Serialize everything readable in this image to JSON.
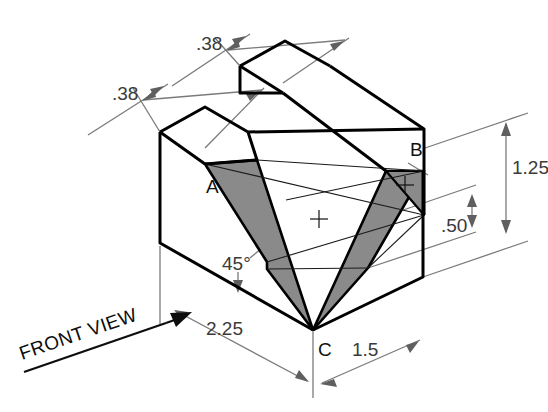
{
  "drawing": {
    "title_label": "FRONT VIEW",
    "background_color": "#ffffff",
    "line_color": "#000000",
    "dimension_line_color": "#7a7a7a",
    "shaded_face_color": "#8a8a8a",
    "projection": "isometric"
  },
  "dimensions": [
    {
      "id": "rail-width-back",
      "value": ".38",
      "x": 196,
      "y": 50
    },
    {
      "id": "rail-width-front",
      "value": ".38",
      "x": 112,
      "y": 100
    },
    {
      "id": "height-total",
      "value": "1.25",
      "x": 512,
      "y": 174
    },
    {
      "id": "notch-depth",
      "value": ".50",
      "x": 455,
      "y": 232
    },
    {
      "id": "length",
      "value": "2.25",
      "x": 231,
      "y": 335
    },
    {
      "id": "width",
      "value": "1.5",
      "x": 363,
      "y": 356
    },
    {
      "id": "notch-angle",
      "value": "45°",
      "x": 238,
      "y": 265
    }
  ],
  "point_labels": [
    {
      "id": "point-a",
      "value": "A",
      "x": 212,
      "y": 193
    },
    {
      "id": "point-b",
      "value": "B",
      "x": 415,
      "y": 156
    },
    {
      "id": "point-c",
      "value": "C",
      "x": 322,
      "y": 356
    }
  ]
}
